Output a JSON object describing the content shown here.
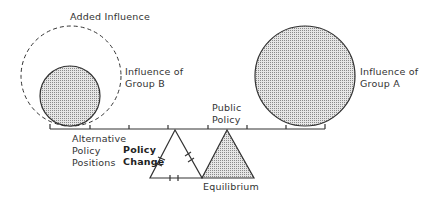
{
  "diagram": {
    "type": "policy-balance",
    "labels": {
      "added_influence": "Added Influence",
      "influence_b_line1": "Influence of",
      "influence_b_line2": "Group B",
      "influence_a_line1": "Influence of",
      "influence_a_line2": "Group A",
      "public_policy_line1": "Public",
      "public_policy_line2": "Policy",
      "alternative_line1": "Alternative",
      "alternative_line2": "Policy",
      "alternative_line3": "Positions",
      "policy_change_line1": "Policy",
      "policy_change_line2": "Change",
      "equilibrium": "Equilibrium"
    },
    "colors": {
      "stroke": "#333333",
      "fill_dot": "#8a8a8a",
      "background": "#ffffff"
    }
  }
}
